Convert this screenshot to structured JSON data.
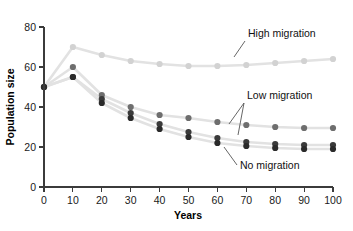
{
  "figure": {
    "caption_remnant": "",
    "background": "#ffffff"
  },
  "axes": {
    "x_title": "Years",
    "y_title": "Population size",
    "x_ticks": [
      "0",
      "10",
      "20",
      "30",
      "40",
      "50",
      "60",
      "70",
      "80",
      "90",
      "100"
    ],
    "y_ticks": [
      "0",
      "20",
      "40",
      "60",
      "80"
    ]
  },
  "annotations": {
    "high": "High migration",
    "low": "Low migration",
    "none": "No migration"
  },
  "colors": {
    "high_migration": "#d2d2d2",
    "low_migration_a": "#6e6e6e",
    "low_migration_b": "#3a3a3a",
    "no_migration": "#2a2a2a",
    "connector": "#e2e2e2",
    "axis": "#3b3b3b",
    "text": "#1a1a1a"
  },
  "chart_data": {
    "type": "line",
    "title": "",
    "xlabel": "Years",
    "ylabel": "Population size",
    "xlim": [
      0,
      100
    ],
    "ylim": [
      0,
      80
    ],
    "xticks": [
      0,
      10,
      20,
      30,
      40,
      50,
      60,
      70,
      80,
      90,
      100
    ],
    "yticks": [
      0,
      20,
      40,
      60,
      80
    ],
    "grid": false,
    "legend": "annotated-labels-with-leader-lines",
    "x": [
      0,
      10,
      20,
      30,
      40,
      50,
      60,
      70,
      80,
      90,
      100
    ],
    "series": [
      {
        "name": "High migration",
        "color": "#d2d2d2",
        "values": [
          50,
          70,
          66,
          63,
          61.5,
          60.5,
          60.5,
          61,
          62,
          63,
          64
        ]
      },
      {
        "name": "Low migration (upper)",
        "color": "#6e6e6e",
        "values": [
          50,
          60,
          46,
          40,
          36,
          34.5,
          32.5,
          31,
          30,
          29.5,
          29.5
        ]
      },
      {
        "name": "Low migration (lower)",
        "color": "#3a3a3a",
        "values": [
          50,
          55,
          44,
          37,
          31.5,
          27.5,
          24.5,
          22.5,
          21.5,
          21,
          21
        ]
      },
      {
        "name": "No migration",
        "color": "#2a2a2a",
        "values": [
          50,
          55,
          42,
          34.5,
          29,
          25,
          22,
          20.5,
          19.5,
          19,
          19
        ]
      }
    ]
  }
}
